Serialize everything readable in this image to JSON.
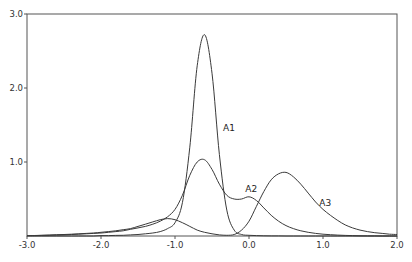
{
  "chart_data": {
    "type": "line",
    "title": "",
    "xlabel": "",
    "ylabel": "",
    "xlim": [
      -3.0,
      2.0
    ],
    "ylim": [
      0,
      3.0
    ],
    "grid": false,
    "legend": "inline curve labels",
    "x_ticks": [
      -3.0,
      -2.0,
      -1.0,
      0.0,
      1.0,
      2.0
    ],
    "x_tick_labels": [
      "-3.0",
      "-2.0",
      "-1.0",
      "0.0",
      "1.0",
      "2.0"
    ],
    "y_ticks": [
      1.0,
      2.0,
      3.0
    ],
    "y_tick_labels": [
      "1.0",
      "2.0",
      "3.0"
    ],
    "x": [
      -3.0,
      -2.9,
      -2.8,
      -2.7,
      -2.6,
      -2.5,
      -2.4,
      -2.3,
      -2.2,
      -2.1,
      -2.0,
      -1.9,
      -1.8,
      -1.7,
      -1.6,
      -1.5,
      -1.4,
      -1.3,
      -1.2,
      -1.1,
      -1.0,
      -0.9,
      -0.8,
      -0.7,
      -0.6,
      -0.5,
      -0.4,
      -0.3,
      -0.2,
      -0.1,
      0.0,
      0.1,
      0.2,
      0.3,
      0.4,
      0.5,
      0.6,
      0.7,
      0.8,
      0.9,
      1.0,
      1.1,
      1.2,
      1.3,
      1.4,
      1.5,
      1.6,
      1.7,
      1.8,
      1.9,
      2.0
    ],
    "series": [
      {
        "name": "A1",
        "label_pos": [
          -0.35,
          1.42
        ],
        "values": [
          0,
          0,
          0,
          0,
          0,
          0,
          0,
          0,
          0,
          0,
          0.005,
          0.006,
          0.008,
          0.01,
          0.015,
          0.02,
          0.03,
          0.04,
          0.06,
          0.1,
          0.18,
          0.45,
          1.2,
          2.3,
          2.72,
          2.2,
          1.1,
          0.35,
          0.08,
          0.02,
          0.01,
          0.005,
          0.003,
          0.002,
          0.001,
          0,
          0,
          0,
          0,
          0,
          0,
          0,
          0,
          0,
          0,
          0,
          0,
          0,
          0,
          0,
          0
        ]
      },
      {
        "name": "A2",
        "label_pos": [
          -0.05,
          0.6
        ],
        "values": [
          0.005,
          0.006,
          0.008,
          0.01,
          0.012,
          0.015,
          0.02,
          0.025,
          0.03,
          0.035,
          0.04,
          0.05,
          0.06,
          0.07,
          0.09,
          0.11,
          0.13,
          0.16,
          0.2,
          0.26,
          0.36,
          0.55,
          0.82,
          1.0,
          1.03,
          0.9,
          0.7,
          0.55,
          0.5,
          0.5,
          0.53,
          0.48,
          0.38,
          0.28,
          0.2,
          0.14,
          0.1,
          0.07,
          0.05,
          0.035,
          0.025,
          0.018,
          0.012,
          0.008,
          0.005,
          0.003,
          0.002,
          0.001,
          0,
          0,
          0
        ]
      },
      {
        "name": "A3",
        "label_pos": [
          0.95,
          0.4
        ],
        "values": [
          0.005,
          0.007,
          0.01,
          0.013,
          0.017,
          0.02,
          0.025,
          0.03,
          0.035,
          0.04,
          0.05,
          0.06,
          0.07,
          0.085,
          0.1,
          0.13,
          0.16,
          0.19,
          0.22,
          0.235,
          0.22,
          0.18,
          0.13,
          0.08,
          0.05,
          0.03,
          0.015,
          0.01,
          0.02,
          0.08,
          0.2,
          0.4,
          0.6,
          0.76,
          0.84,
          0.86,
          0.8,
          0.7,
          0.58,
          0.46,
          0.36,
          0.28,
          0.21,
          0.15,
          0.11,
          0.08,
          0.06,
          0.045,
          0.035,
          0.025,
          0.02
        ]
      }
    ]
  },
  "plot": {
    "left": 27,
    "right": 397,
    "top": 14,
    "bottom": 236,
    "line_color": "#3a3a3a",
    "axis_color": "#555555"
  }
}
